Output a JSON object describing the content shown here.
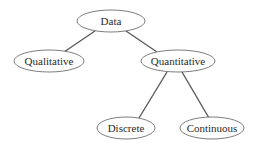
{
  "diagram": {
    "type": "tree",
    "nodes": {
      "data": {
        "label": "Data"
      },
      "qualitative": {
        "label": "Qualitative"
      },
      "quantitative": {
        "label": "Quantitative"
      },
      "discrete": {
        "label": "Discrete"
      },
      "continuous": {
        "label": "Continuous"
      }
    },
    "edges": [
      {
        "from": "Data",
        "to": "Qualitative"
      },
      {
        "from": "Data",
        "to": "Quantitative"
      },
      {
        "from": "Quantitative",
        "to": "Discrete"
      },
      {
        "from": "Quantitative",
        "to": "Continuous"
      }
    ]
  }
}
